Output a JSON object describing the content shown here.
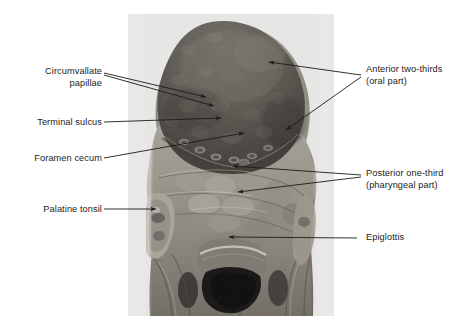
{
  "figure": {
    "kind": "anatomy-photograph",
    "photo": {
      "x": 128,
      "y": 14,
      "width": 206,
      "height": 302,
      "background_color": "#ededed",
      "tone_dark": "#4a4a4a",
      "tone_mid": "#8d8a84",
      "tone_light": "#c9c5bd"
    },
    "leader_color": "#1b1b1b",
    "labels": [
      {
        "id": "circumvallate-papillae",
        "text": "Circumvallate\npapillae",
        "align": "right",
        "x": 30,
        "y": 66,
        "width": 72,
        "leaders": [
          {
            "x1": 104,
            "y1": 73,
            "x2": 206,
            "y2": 97
          },
          {
            "x1": 104,
            "y1": 75,
            "x2": 214,
            "y2": 106
          }
        ]
      },
      {
        "id": "terminal-sulcus",
        "text": "Terminal sulcus",
        "align": "right",
        "x": 22,
        "y": 117,
        "width": 80,
        "leaders": [
          {
            "x1": 104,
            "y1": 122,
            "x2": 221,
            "y2": 118
          }
        ]
      },
      {
        "id": "foramen-cecum",
        "text": "Foramen cecum",
        "align": "right",
        "x": 20,
        "y": 153,
        "width": 82,
        "leaders": [
          {
            "x1": 104,
            "y1": 158,
            "x2": 244,
            "y2": 133
          }
        ]
      },
      {
        "id": "palatine-tonsil",
        "text": "Palatine tonsil",
        "align": "right",
        "x": 28,
        "y": 204,
        "width": 74,
        "leaders": [
          {
            "x1": 104,
            "y1": 209,
            "x2": 156,
            "y2": 209
          }
        ]
      },
      {
        "id": "anterior-two-thirds",
        "text": "Anterior two-thirds\n(oral part)",
        "align": "left",
        "x": 366,
        "y": 64,
        "width": 100,
        "leaders": [
          {
            "x1": 361,
            "y1": 75,
            "x2": 269,
            "y2": 62
          },
          {
            "x1": 361,
            "y1": 77,
            "x2": 286,
            "y2": 130
          }
        ]
      },
      {
        "id": "posterior-one-third",
        "text": "Posterior one-third\n(pharyngeal part)",
        "align": "left",
        "x": 366,
        "y": 168,
        "width": 100,
        "leaders": [
          {
            "x1": 361,
            "y1": 175,
            "x2": 233,
            "y2": 166
          },
          {
            "x1": 361,
            "y1": 177,
            "x2": 238,
            "y2": 192
          }
        ]
      },
      {
        "id": "epiglottis",
        "text": "Epiglottis",
        "align": "left",
        "x": 366,
        "y": 232,
        "width": 60,
        "leaders": [
          {
            "x1": 357,
            "y1": 238,
            "x2": 229,
            "y2": 237
          }
        ]
      }
    ]
  }
}
